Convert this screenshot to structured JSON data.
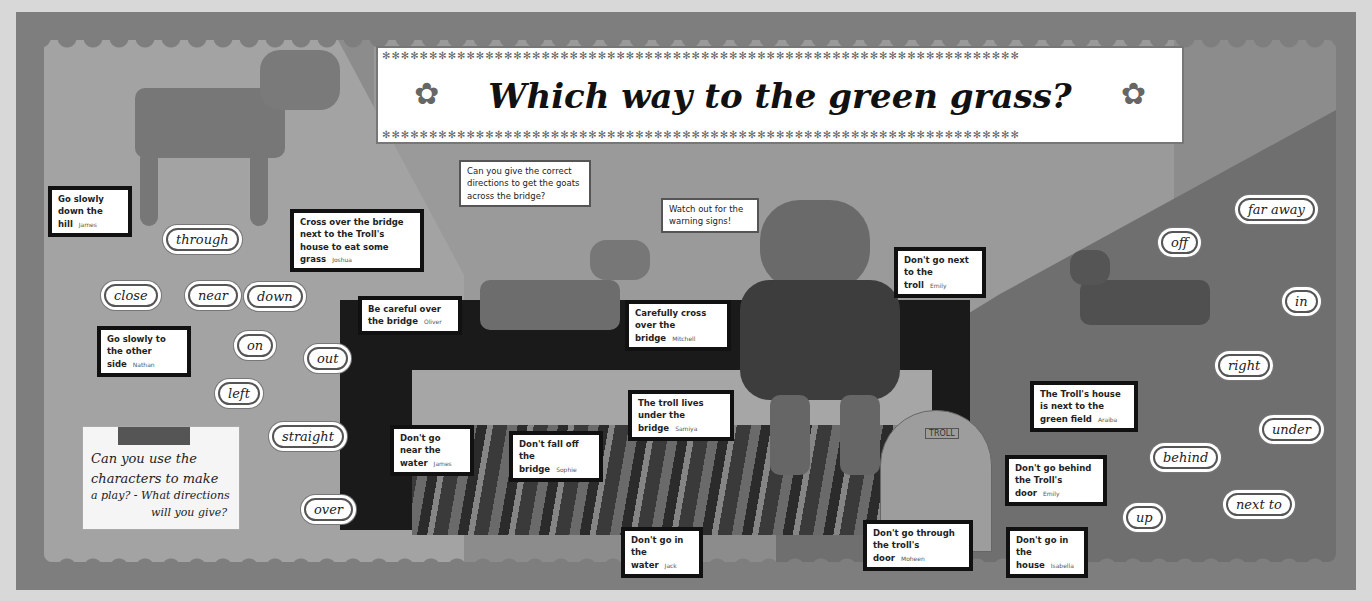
{
  "banner": {
    "title": "Which way to the green grass?",
    "stars": "✻✻✻✻✻✻✻✻✻✻✻✻✻✻✻✻✻✻✻✻✻✻✻✻✻✻✻✻✻✻✻✻✻✻✻✻✻✻✻✻✻✻✻✻✻✻✻✻✻✻✻✻✻✻✻✻✻✻✻✻✻✻✻✻✻✻✻✻",
    "flower": "✿"
  },
  "prompt_card": "Can you give the correct directions to get the goats across the bridge?",
  "warning_card": "Watch out for the warning signs!",
  "note": {
    "text_line1": "Can you use the",
    "text_line2": "characters to make",
    "text_line3": "a play? - What directions",
    "text_line4": "will you give?"
  },
  "cards": [
    {
      "text": "Go slowly down the hill",
      "name": "James"
    },
    {
      "text": "Cross over the bridge next to the Troll's house to eat some grass",
      "name": "Joshua"
    },
    {
      "text": "Go slowly to the other side",
      "name": "Nathan"
    },
    {
      "text": "Be careful over the bridge",
      "name": "Oliver"
    },
    {
      "text": "Carefully cross over the bridge",
      "name": "Mitchell"
    },
    {
      "text": "Don't go next to the troll",
      "name": "Emily"
    },
    {
      "text": "The Troll's house is next to the green field",
      "name": "Araiba"
    },
    {
      "text": "The troll lives under the bridge",
      "name": "Samiya"
    },
    {
      "text": "Don't go near the water",
      "name": "James"
    },
    {
      "text": "Don't fall off the bridge",
      "name": "Sophie"
    },
    {
      "text": "Don't go in the water",
      "name": "Jack"
    },
    {
      "text": "Don't go through the troll's door",
      "name": "Moheen"
    },
    {
      "text": "Don't go behind the Troll's door",
      "name": "Emily"
    },
    {
      "text": "Don't go in the house",
      "name": "Isabella"
    }
  ],
  "words": [
    "through",
    "close",
    "near",
    "down",
    "on",
    "out",
    "left",
    "straight",
    "over",
    "far away",
    "off",
    "in",
    "right",
    "under",
    "behind",
    "next to",
    "up"
  ],
  "door_sign": "TROLL"
}
